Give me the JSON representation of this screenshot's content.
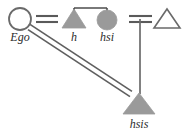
{
  "diagram": {
    "type": "kinship-diagram",
    "width": 186,
    "height": 133,
    "background_color": "#ffffff",
    "fill_color": "#9a9a9a",
    "stroke_color": "#5a5a5a",
    "label_color": "#2b2b2b",
    "nodes": [
      {
        "id": "ego",
        "label": "Ego",
        "shape": "circle-open",
        "name": "ego-node",
        "cx": 20,
        "cy": 19,
        "r": 11,
        "label_x": 20,
        "label_y": 40
      },
      {
        "id": "h",
        "label": "h",
        "shape": "triangle-filled",
        "name": "husband-node",
        "cx": 74,
        "cy": 20,
        "half_width": 12,
        "height": 17,
        "label_x": 74,
        "label_y": 40
      },
      {
        "id": "hsi",
        "label": "hsi",
        "shape": "circle-filled",
        "name": "husband-sister-node",
        "cx": 107,
        "cy": 20,
        "r": 10,
        "label_x": 107,
        "label_y": 40
      },
      {
        "id": "hsih",
        "label": "",
        "shape": "triangle-open",
        "name": "husband-sister-husband-node",
        "cx": 167,
        "cy": 20,
        "half_width": 13,
        "height": 18,
        "label_x": 167,
        "label_y": 40
      },
      {
        "id": "hsis",
        "label": "hsis",
        "shape": "triangle-filled",
        "name": "husband-sister-son-node",
        "cx": 138,
        "cy": 105,
        "half_width": 16,
        "height": 19,
        "label_x": 138,
        "label_y": 126
      }
    ],
    "links": [
      {
        "id": "ego-h-marriage",
        "name": "marriage-link-ego-h",
        "type": "double-horizontal",
        "x1": 36,
        "x2": 58,
        "y_top": 16,
        "y_bottom": 22
      },
      {
        "id": "hsi-hsih-marriage",
        "name": "marriage-link-hsi-hsih",
        "type": "double-horizontal",
        "x1": 129,
        "x2": 152,
        "y_top": 16,
        "y_bottom": 22
      },
      {
        "id": "h-hsi-sibling",
        "name": "sibling-link-h-hsi",
        "type": "sibling-bar",
        "x1": 74,
        "x2": 107,
        "y": 8,
        "drop_left_to": 13,
        "drop_right_to": 10
      },
      {
        "id": "hsi-hsih-to-hsis",
        "name": "descent-link-to-hsis",
        "type": "vertical",
        "x": 140,
        "y1": 19,
        "y2": 92
      },
      {
        "id": "ego-hsis",
        "name": "double-diagonal-link-ego-hsis",
        "type": "double-diagonal",
        "x1": 29,
        "y1": 27,
        "x2": 131,
        "y2": 94,
        "offset": 3
      }
    ],
    "labels": {
      "ego": "Ego",
      "h": "h",
      "hsi": "hsi",
      "hsis": "hsis"
    }
  }
}
